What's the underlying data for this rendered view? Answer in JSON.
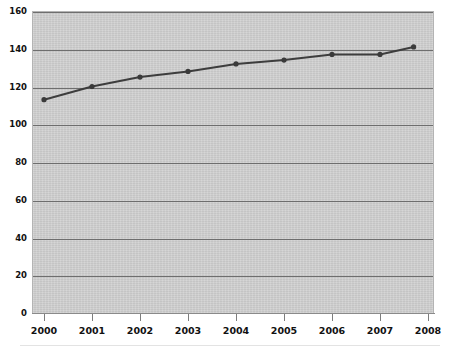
{
  "chart_data": {
    "type": "line",
    "title": "",
    "subtitle": "",
    "xlabel": "",
    "ylabel": "",
    "x": [
      2000,
      2001,
      2002,
      2003,
      2004,
      2005,
      2006,
      2007,
      2007.7
    ],
    "categories": [
      "2000",
      "2001",
      "2002",
      "2003",
      "2004",
      "2005",
      "2006",
      "2007",
      "2008"
    ],
    "values": [
      113,
      120,
      125,
      128,
      132,
      134,
      137,
      137,
      141
    ],
    "series": [
      {
        "name": "series-1",
        "values": [
          113,
          120,
          125,
          128,
          132,
          134,
          137,
          137,
          141
        ]
      }
    ],
    "ylim": [
      0,
      160
    ],
    "xlim": [
      2000,
      2008
    ],
    "yticks": [
      0,
      20,
      40,
      60,
      80,
      100,
      120,
      140,
      160
    ],
    "ytick_labels": [
      "0",
      "20",
      "40",
      "60",
      "80",
      "100",
      "120",
      "140",
      "160"
    ],
    "xticks": [
      2000,
      2001,
      2002,
      2003,
      2004,
      2005,
      2006,
      2007,
      2008
    ],
    "xtick_labels": [
      "2000",
      "2001",
      "2002",
      "2003",
      "2004",
      "2005",
      "2006",
      "2007",
      "2008"
    ],
    "grid": "horizontal",
    "legend": "none",
    "marker": "circle",
    "line_color": "#3d3d3d",
    "marker_color": "#3a3a3a",
    "plot_background": "#d2d2d2",
    "gridline_color": "#6e6e6e",
    "figure_background": "#ffffff"
  }
}
